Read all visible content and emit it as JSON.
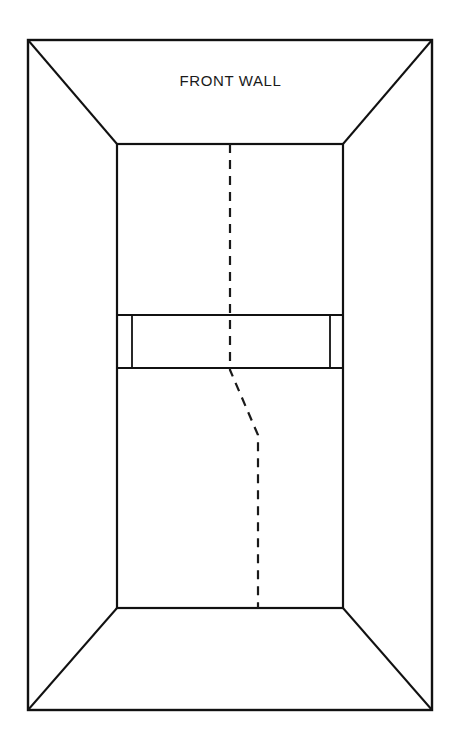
{
  "figure": {
    "kind": "perspective-room-interior-diagram",
    "background_color": "#ffffff",
    "line_color": "#111111",
    "labels": {
      "front_wall": "FRONT WALL"
    },
    "label_positions": {
      "front_wall": {
        "x": 230,
        "y": 82
      }
    },
    "geometry": {
      "outer_rect": {
        "left": 28,
        "top": 40,
        "right": 432,
        "bottom": 710
      },
      "inner_rect": {
        "left": 117,
        "top": 144,
        "right": 343,
        "bottom": 608
      },
      "corner_diagonals": [
        {
          "name": "top-left",
          "from": [
            28,
            40
          ],
          "to": [
            117,
            144
          ]
        },
        {
          "name": "top-right",
          "from": [
            432,
            40
          ],
          "to": [
            343,
            144
          ]
        },
        {
          "name": "bottom-left",
          "from": [
            28,
            710
          ],
          "to": [
            117,
            608
          ]
        },
        {
          "name": "bottom-right",
          "from": [
            432,
            710
          ],
          "to": [
            343,
            608
          ]
        }
      ],
      "mid_band": {
        "left": 117,
        "right": 343,
        "top": 315,
        "bottom": 368,
        "inner_left_divider_x": 132,
        "inner_right_divider_x": 330
      },
      "dashed_path": {
        "stroke_dasharray": "9 7",
        "points": [
          [
            230,
            144
          ],
          [
            230,
            370
          ],
          [
            258,
            435
          ],
          [
            258,
            608
          ]
        ]
      }
    },
    "stroke_widths": {
      "outer_frame": 2.4,
      "inner_frame": 2.2,
      "band": 2.0,
      "band_divider": 1.8,
      "dashed": 2.2
    }
  }
}
